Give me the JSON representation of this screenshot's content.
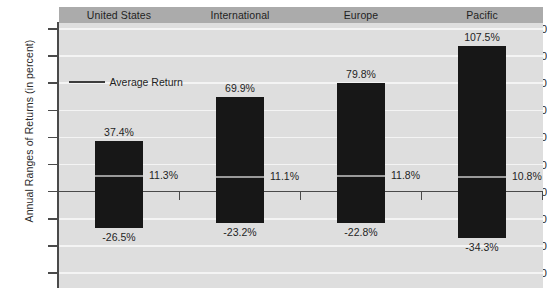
{
  "chart_data": {
    "type": "bar",
    "title": "",
    "xlabel": "",
    "ylabel": "Annual Ranges of Returns (in percent)",
    "ylim": [
      -60,
      120
    ],
    "ytick_step": 20,
    "yticks": [
      120,
      100,
      80,
      60,
      40,
      20,
      0,
      -20,
      -40,
      -60
    ],
    "ytick_labels": [
      "120",
      "100",
      "80",
      "60",
      "40",
      "20",
      "0",
      "-20",
      "-40",
      "-60"
    ],
    "grid": true,
    "grid_color": "#f4f4f4",
    "plot_background": "#dedede",
    "bar_color": "#171717",
    "average_line_color": "#9a9a9a",
    "legend": {
      "position": "inside-upper-left",
      "entries": [
        {
          "label": "Average Return",
          "marker": "line",
          "color": "#3d3d3d"
        }
      ]
    },
    "categories": [
      "United States",
      "International",
      "Europe",
      "Pacific"
    ],
    "series": [
      {
        "name": "High",
        "values": [
          37.4,
          69.9,
          79.8,
          107.5
        ],
        "labels": [
          "37.4%",
          "69.9%",
          "79.8%",
          "107.5%"
        ]
      },
      {
        "name": "Low",
        "values": [
          -26.5,
          -23.2,
          -22.8,
          -34.3
        ],
        "labels": [
          "-26.5%",
          "-23.2%",
          "-22.8%",
          "-34.3%"
        ]
      },
      {
        "name": "Average Return",
        "values": [
          11.3,
          11.1,
          11.8,
          10.8
        ],
        "labels": [
          "11.3%",
          "11.1%",
          "11.8%",
          "10.8%"
        ]
      }
    ]
  },
  "header": {
    "columns": [
      "United States",
      "International",
      "Europe",
      "Pacific"
    ]
  },
  "axis": {
    "y_title": "Annual Ranges of Returns (in percent)",
    "y_labels": [
      "120",
      "100",
      "80",
      "60",
      "40",
      "20",
      "0",
      "-20",
      "-40",
      "-60"
    ]
  },
  "legend": {
    "average_return_label": "Average Return"
  },
  "bars": [
    {
      "category": "United States",
      "high_label": "37.4%",
      "low_label": "-26.5%",
      "avg_label": "11.3%"
    },
    {
      "category": "International",
      "high_label": "69.9%",
      "low_label": "-23.2%",
      "avg_label": "11.1%"
    },
    {
      "category": "Europe",
      "high_label": "79.8%",
      "low_label": "-22.8%",
      "avg_label": "11.8%"
    },
    {
      "category": "Pacific",
      "high_label": "107.5%",
      "low_label": "-34.3%",
      "avg_label": "10.8%"
    }
  ]
}
